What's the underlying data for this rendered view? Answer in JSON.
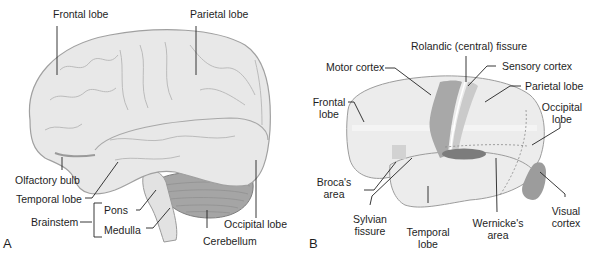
{
  "panel_a": {
    "letter": "A",
    "labels": {
      "frontal_lobe": "Frontal lobe",
      "parietal_lobe": "Parietal lobe",
      "olfactory_bulb": "Olfactory bulb",
      "temporal_lobe": "Temporal lobe",
      "brainstem": "Brainstem",
      "pons": "Pons",
      "medulla": "Medulla",
      "cerebellum": "Cerebellum",
      "occipital_lobe": "Occipital lobe"
    }
  },
  "panel_b": {
    "letter": "B",
    "labels": {
      "rolandic_fissure": "Rolandic (central) fissure",
      "motor_cortex": "Motor cortex",
      "sensory_cortex": "Sensory cortex",
      "parietal_lobe": "Parietal lobe",
      "frontal_lobe_1": "Frontal",
      "frontal_lobe_2": "lobe",
      "occipital_lobe_1": "Occipital",
      "occipital_lobe_2": "lobe",
      "brocas_area_1": "Broca's",
      "brocas_area_2": "area",
      "sylvian_fissure_1": "Sylvian",
      "sylvian_fissure_2": "fissure",
      "temporal_lobe_1": "Temporal",
      "temporal_lobe_2": "lobe",
      "wernickes_area_1": "Wernicke's",
      "wernickes_area_2": "area",
      "visual_cortex_1": "Visual",
      "visual_cortex_2": "cortex"
    }
  },
  "colors": {
    "brain_fill": "#e6e6e6",
    "brain_outline": "#9a9a9a",
    "cerebellum": "#9c9c9c",
    "motor_cortex": "#a8a8a8",
    "sensory_cortex": "#c8c8c8",
    "wernickes": "#7a7a7a",
    "visual_cortex": "#9a9a9a",
    "brocas": "#d0d0d0",
    "leader_line": "#222222"
  }
}
